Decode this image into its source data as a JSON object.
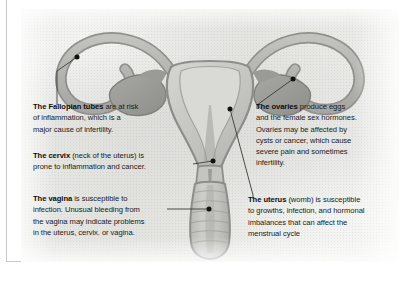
{
  "document": {
    "type": "anatomical-illustration",
    "subject": "Female reproductive system",
    "view": "coronal-cross-section"
  },
  "colors": {
    "page_background": "#ffffff",
    "plate_background": "#e6e6e3",
    "text": "#1b1b1b",
    "heading": "#0d0d0d",
    "leader_line": "#3a3a3a",
    "leader_dot": "#111111",
    "organ_outline": "#8d8d8b",
    "organ_wall": "#b7b7b3",
    "organ_fill": "#cfcfcb",
    "organ_dark": "#9a9a96",
    "cavity": "#dcdcd8"
  },
  "callouts": {
    "fallopian": {
      "name": "fallopian-tubes",
      "lead": "The Fallopian tubes",
      "lines": [
        " are at risk",
        "of inflammation, which is a",
        "major cause of infertility."
      ]
    },
    "cervix": {
      "name": "cervix",
      "lead": "The cervix",
      "lines": [
        " (neck of the uterus) is",
        "prone to inflammation and cancer."
      ]
    },
    "vagina": {
      "name": "vagina",
      "lead": "The vagina",
      "lines": [
        " is susceptible to",
        "infection. Unusual bleeding from",
        "the vagina may indicate problems",
        "in the uterus, cervix. or vagina."
      ]
    },
    "ovaries": {
      "name": "ovaries",
      "lead": "The ovaries",
      "lines": [
        " produce eggs",
        "and the female sex hormones.",
        "Ovaries may be affected by",
        "cysts or cancer, which cause",
        "severe pain and sometimes",
        "infertility."
      ]
    },
    "uterus": {
      "name": "uterus",
      "lead": "The uterus",
      "lines": [
        " (womb) is susceptible",
        "to growths, infection, and hormonal",
        "imbalances that can affect the",
        "menstrual cycle"
      ]
    }
  },
  "labels": {
    "plate": "scanned-anatomy-plate",
    "illustration": "female-reproductive-system-illustration"
  }
}
